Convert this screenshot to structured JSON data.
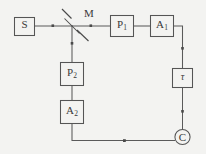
{
  "diagram": {
    "background_color": "#f3f3f1",
    "line_color": "#555555",
    "text_color": "#3a3a3a",
    "components": [
      {
        "id": "source",
        "label": "S",
        "sub": "",
        "shape": "rect",
        "meaning": "light source",
        "x": 14,
        "y": 17,
        "w": 20,
        "h": 18
      },
      {
        "id": "mirror",
        "label": "M",
        "sub": "",
        "shape": "beam-splitter",
        "meaning": "beam splitter / half-silvered mirror",
        "x": 72,
        "y": 25
      },
      {
        "id": "polarizer-1",
        "label": "P",
        "sub": "1",
        "shape": "rect",
        "meaning": "polarizer 1",
        "x": 110,
        "y": 15,
        "w": 24,
        "h": 21
      },
      {
        "id": "analyzer-1",
        "label": "A",
        "sub": "1",
        "shape": "rect",
        "meaning": "analyzer 1",
        "x": 150,
        "y": 15,
        "w": 24,
        "h": 21
      },
      {
        "id": "delay",
        "label": "τ",
        "sub": "",
        "shape": "rect",
        "meaning": "delay line tau",
        "x": 172,
        "y": 68,
        "w": 21,
        "h": 20
      },
      {
        "id": "coincidence",
        "label": "C",
        "sub": "",
        "shape": "circle",
        "meaning": "coincidence counter",
        "x": 182,
        "y": 137,
        "r": 8
      },
      {
        "id": "polarizer-2",
        "label": "P",
        "sub": "2",
        "shape": "rect",
        "meaning": "polarizer 2",
        "x": 60,
        "y": 62,
        "w": 24,
        "h": 24
      },
      {
        "id": "analyzer-2",
        "label": "A",
        "sub": "2",
        "shape": "rect",
        "meaning": "analyzer 2",
        "x": 60,
        "y": 100,
        "w": 24,
        "h": 24
      }
    ],
    "labels": {
      "mirror_caption": "M"
    }
  }
}
